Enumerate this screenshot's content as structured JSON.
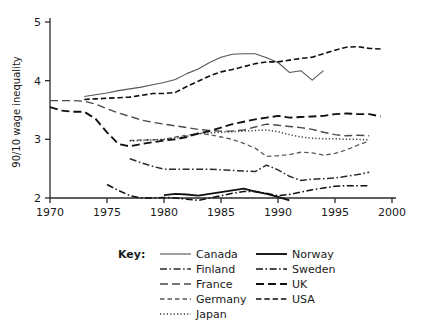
{
  "chart_data": {
    "type": "line",
    "title": "",
    "xlabel": "",
    "ylabel": "90/10 wage inequality",
    "xlim": [
      1970,
      2000
    ],
    "ylim": [
      2,
      5
    ],
    "xticks": [
      "1970",
      "1975",
      "1980",
      "1985",
      "1990",
      "1995",
      "2000"
    ],
    "yticks": [
      "2",
      "3",
      "4",
      "5"
    ],
    "grid": false,
    "legend_position": "below",
    "legend_title": "Key:",
    "series": [
      {
        "name": "Canada",
        "style": "solid-thin",
        "color": "#555555",
        "x": [
          1973,
          1974,
          1975,
          1976,
          1977,
          1978,
          1979,
          1980,
          1981,
          1982,
          1983,
          1984,
          1985,
          1986,
          1987,
          1988,
          1989,
          1990,
          1991,
          1992,
          1993,
          1994
        ],
        "y": [
          3.73,
          3.76,
          3.79,
          3.83,
          3.86,
          3.89,
          3.93,
          3.97,
          4.02,
          4.12,
          4.2,
          4.31,
          4.4,
          4.45,
          4.46,
          4.46,
          4.39,
          4.31,
          4.14,
          4.17,
          4.01,
          4.17
        ]
      },
      {
        "name": "Finland",
        "style": "dash-dot",
        "color": "#2b2b2b",
        "x": [
          1977,
          1978,
          1979,
          1980,
          1981,
          1982,
          1983,
          1984,
          1985,
          1986,
          1987,
          1988,
          1989,
          1990,
          1991,
          1992,
          1993,
          1994,
          1995,
          1996,
          1997,
          1998
        ],
        "y": [
          2.67,
          2.6,
          2.54,
          2.49,
          2.49,
          2.49,
          2.49,
          2.49,
          2.48,
          2.47,
          2.46,
          2.45,
          2.56,
          2.48,
          2.37,
          2.3,
          2.32,
          2.33,
          2.34,
          2.37,
          2.4,
          2.44
        ]
      },
      {
        "name": "France",
        "style": "long-dash",
        "color": "#4a4a4a",
        "x": [
          1970,
          1971,
          1972,
          1973,
          1974,
          1975,
          1976,
          1977,
          1978,
          1979,
          1980,
          1981,
          1982,
          1983,
          1984,
          1985,
          1986,
          1987,
          1988,
          1989,
          1990,
          1991,
          1992,
          1993,
          1994,
          1995,
          1996,
          1997,
          1998
        ],
        "y": [
          3.66,
          3.66,
          3.66,
          3.65,
          3.6,
          3.52,
          3.45,
          3.39,
          3.33,
          3.29,
          3.26,
          3.23,
          3.2,
          3.17,
          3.15,
          3.14,
          3.14,
          3.16,
          3.21,
          3.26,
          3.24,
          3.22,
          3.2,
          3.17,
          3.12,
          3.08,
          3.06,
          3.07,
          3.06
        ]
      },
      {
        "name": "Germany",
        "style": "short-dash",
        "color": "#5a5a5a",
        "x": [
          1977,
          1978,
          1979,
          1980,
          1981,
          1982,
          1983,
          1984,
          1985,
          1986,
          1987,
          1988,
          1989,
          1990,
          1991,
          1992,
          1993,
          1994,
          1995,
          1996,
          1997,
          1998
        ],
        "y": [
          2.98,
          2.99,
          2.99,
          3.0,
          3.04,
          3.07,
          3.1,
          3.08,
          3.04,
          3.0,
          2.93,
          2.85,
          2.71,
          2.72,
          2.74,
          2.78,
          2.77,
          2.73,
          2.76,
          2.82,
          2.9,
          2.97
        ]
      },
      {
        "name": "Japan",
        "style": "dotted",
        "color": "#3a3a3a",
        "x": [
          1977,
          1978,
          1979,
          1980,
          1981,
          1982,
          1983,
          1984,
          1985,
          1986,
          1987,
          1988,
          1989,
          1990,
          1991,
          1992,
          1993,
          1994,
          1995,
          1996,
          1997,
          1998
        ],
        "y": [
          2.97,
          2.98,
          2.99,
          3.0,
          3.02,
          3.05,
          3.1,
          3.11,
          3.12,
          3.13,
          3.14,
          3.15,
          3.16,
          3.13,
          3.08,
          3.04,
          3.02,
          3.01,
          3.01,
          3.0,
          3.0,
          2.99
        ]
      },
      {
        "name": "Norway",
        "style": "solid-thick",
        "color": "#111111",
        "x": [
          1980,
          1981,
          1982,
          1983,
          1984,
          1985,
          1986,
          1987,
          1988,
          1989,
          1990,
          1991
        ],
        "y": [
          2.05,
          2.07,
          2.06,
          2.04,
          2.07,
          2.1,
          2.13,
          2.16,
          2.11,
          2.07,
          2.02,
          1.96
        ]
      },
      {
        "name": "Sweden",
        "style": "dash-dot",
        "color": "#111111",
        "x": [
          1975,
          1976,
          1977,
          1978,
          1979,
          1980,
          1981,
          1982,
          1983,
          1984,
          1985,
          1986,
          1987,
          1988,
          1989,
          1990,
          1991,
          1992,
          1993,
          1994,
          1995,
          1996,
          1997,
          1998
        ],
        "y": [
          2.23,
          2.13,
          2.04,
          2.0,
          2.0,
          2.01,
          2.0,
          1.98,
          1.96,
          2.0,
          2.04,
          2.08,
          2.11,
          2.11,
          2.08,
          2.04,
          2.06,
          2.1,
          2.14,
          2.17,
          2.2,
          2.21,
          2.21,
          2.21
        ]
      },
      {
        "name": "UK",
        "style": "long-dash-thick",
        "color": "#111111",
        "x": [
          1970,
          1971,
          1972,
          1973,
          1974,
          1975,
          1976,
          1977,
          1978,
          1979,
          1980,
          1981,
          1982,
          1983,
          1984,
          1985,
          1986,
          1987,
          1988,
          1989,
          1990,
          1991,
          1992,
          1993,
          1994,
          1995,
          1996,
          1997,
          1998,
          1999
        ],
        "y": [
          3.55,
          3.49,
          3.47,
          3.47,
          3.35,
          3.12,
          2.92,
          2.88,
          2.92,
          2.95,
          2.98,
          3.0,
          3.04,
          3.1,
          3.14,
          3.2,
          3.26,
          3.3,
          3.34,
          3.37,
          3.4,
          3.37,
          3.38,
          3.39,
          3.4,
          3.43,
          3.44,
          3.43,
          3.43,
          3.39
        ]
      },
      {
        "name": "USA",
        "style": "medium-dash",
        "color": "#111111",
        "x": [
          1973,
          1974,
          1975,
          1976,
          1977,
          1978,
          1979,
          1980,
          1981,
          1982,
          1983,
          1984,
          1985,
          1986,
          1987,
          1988,
          1989,
          1990,
          1991,
          1992,
          1993,
          1994,
          1995,
          1996,
          1997,
          1998,
          1999
        ],
        "y": [
          3.68,
          3.69,
          3.7,
          3.71,
          3.72,
          3.75,
          3.78,
          3.78,
          3.8,
          3.9,
          3.99,
          4.08,
          4.15,
          4.19,
          4.24,
          4.29,
          4.32,
          4.32,
          4.35,
          4.38,
          4.4,
          4.46,
          4.52,
          4.57,
          4.58,
          4.55,
          4.54
        ]
      }
    ]
  },
  "legend": {
    "title": "Key:",
    "column_left": [
      {
        "label": "Canada"
      },
      {
        "label": "Finland"
      },
      {
        "label": "France"
      },
      {
        "label": "Germany"
      },
      {
        "label": "Japan"
      }
    ],
    "column_right": [
      {
        "label": "Norway"
      },
      {
        "label": "Sweden"
      },
      {
        "label": "UK"
      },
      {
        "label": "USA"
      }
    ]
  }
}
